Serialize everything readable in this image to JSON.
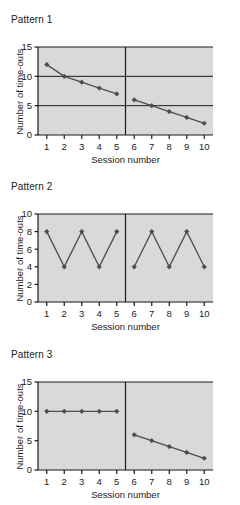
{
  "figure": {
    "background": "#ffffff",
    "plot_background": "#d9d9d9",
    "line_color": "#4d4d4d",
    "marker_color": "#4d4d4d",
    "axis_color": "#1a1a1a",
    "grid_color": "#1a1a1a",
    "text_color": "#1a1a1a"
  },
  "panels": [
    {
      "title": "Pattern 1",
      "chart_data": {
        "type": "line",
        "title": "Pattern 1",
        "xlabel": "Session number",
        "ylabel": "Number of time-outs",
        "xlim": [
          0.5,
          10.5
        ],
        "ylim": [
          0,
          15
        ],
        "yticks": [
          0,
          5,
          10,
          15
        ],
        "ytick_labels": [
          "0",
          "5",
          "10",
          "15"
        ],
        "xticks": [
          1,
          2,
          3,
          4,
          5,
          6,
          7,
          8,
          9,
          10
        ],
        "xtick_labels": [
          "1",
          "2",
          "3",
          "4",
          "5",
          "6",
          "7",
          "8",
          "9",
          "10"
        ],
        "grid": true,
        "gridlines_y": [
          5,
          10
        ],
        "legend": null,
        "phase_divider_x": 5.5,
        "series": [
          {
            "name": "Phase A",
            "x": [
              1,
              2,
              3,
              4,
              5
            ],
            "values": [
              12,
              10,
              9,
              8,
              7
            ]
          },
          {
            "name": "Phase B",
            "x": [
              6,
              7,
              8,
              9,
              10
            ],
            "values": [
              6,
              5,
              4,
              3,
              2
            ]
          }
        ]
      }
    },
    {
      "title": "Pattern 2",
      "chart_data": {
        "type": "line",
        "title": "Pattern 2",
        "xlabel": "Session number",
        "ylabel": "Number of time-outs",
        "xlim": [
          0.5,
          10.5
        ],
        "ylim": [
          0,
          10
        ],
        "yticks": [
          0,
          2,
          4,
          6,
          8,
          10
        ],
        "ytick_labels": [
          "0",
          "2",
          "4",
          "6",
          "8",
          "10"
        ],
        "xticks": [
          1,
          2,
          3,
          4,
          5,
          6,
          7,
          8,
          9,
          10
        ],
        "xtick_labels": [
          "1",
          "2",
          "3",
          "4",
          "5",
          "6",
          "7",
          "8",
          "9",
          "10"
        ],
        "grid": false,
        "gridlines_y": [],
        "legend": null,
        "phase_divider_x": 5.5,
        "series": [
          {
            "name": "Phase A",
            "x": [
              1,
              2,
              3,
              4,
              5
            ],
            "values": [
              8,
              4,
              8,
              4,
              8
            ]
          },
          {
            "name": "Phase B",
            "x": [
              6,
              7,
              8,
              9,
              10
            ],
            "values": [
              4,
              8,
              4,
              8,
              4
            ]
          }
        ]
      }
    },
    {
      "title": "Pattern 3",
      "chart_data": {
        "type": "line",
        "title": "Pattern 3",
        "xlabel": "Session number",
        "ylabel": "Number of time-outs",
        "xlim": [
          0.5,
          10.5
        ],
        "ylim": [
          0,
          15
        ],
        "yticks": [
          0,
          5,
          10,
          15
        ],
        "ytick_labels": [
          "0",
          "5",
          "10",
          "15"
        ],
        "xticks": [
          1,
          2,
          3,
          4,
          5,
          6,
          7,
          8,
          9,
          10
        ],
        "xtick_labels": [
          "1",
          "2",
          "3",
          "4",
          "5",
          "6",
          "7",
          "8",
          "9",
          "10"
        ],
        "grid": false,
        "gridlines_y": [],
        "legend": null,
        "phase_divider_x": 5.5,
        "series": [
          {
            "name": "Phase A",
            "x": [
              1,
              2,
              3,
              4,
              5
            ],
            "values": [
              10,
              10,
              10,
              10,
              10
            ]
          },
          {
            "name": "Phase B",
            "x": [
              6,
              7,
              8,
              9,
              10
            ],
            "values": [
              6,
              5,
              4,
              3,
              2
            ]
          }
        ]
      }
    }
  ]
}
